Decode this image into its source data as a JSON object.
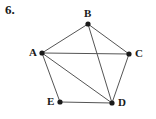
{
  "problem": {
    "number_label": "6."
  },
  "figure": {
    "kind": "undirected-graph-diagram",
    "width": 156,
    "height": 119,
    "background_color": "#ffffff",
    "edge_color": "#555555",
    "vertex_color": "#1a1a1a",
    "label_color": "#1a1a1a",
    "edge_width": 1,
    "vertex_radius": 2.6
  },
  "chart_data": {
    "type": "diagram",
    "title": "",
    "vertices": [
      {
        "id": "A",
        "label": "A",
        "x": 42,
        "y": 53,
        "label_x": 29,
        "label_y": 47,
        "degree": 4
      },
      {
        "id": "B",
        "label": "B",
        "x": 88,
        "y": 24,
        "label_x": 84,
        "label_y": 8,
        "degree": 3
      },
      {
        "id": "C",
        "label": "C",
        "x": 129,
        "y": 54,
        "label_x": 135,
        "label_y": 48,
        "degree": 3
      },
      {
        "id": "D",
        "label": "D",
        "x": 112,
        "y": 103,
        "label_x": 118,
        "label_y": 97,
        "degree": 4
      },
      {
        "id": "E",
        "label": "E",
        "x": 60,
        "y": 102,
        "label_x": 47,
        "label_y": 96,
        "degree": 3
      }
    ],
    "edges": [
      {
        "from": "A",
        "to": "B"
      },
      {
        "from": "B",
        "to": "C"
      },
      {
        "from": "C",
        "to": "D"
      },
      {
        "from": "D",
        "to": "E"
      },
      {
        "from": "E",
        "to": "A"
      },
      {
        "from": "A",
        "to": "C"
      },
      {
        "from": "A",
        "to": "D"
      },
      {
        "from": "B",
        "to": "D"
      }
    ],
    "vertex_count": 5,
    "edge_count": 8
  }
}
